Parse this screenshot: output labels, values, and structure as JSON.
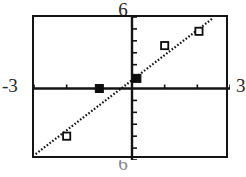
{
  "graph": {
    "type": "graphing-calculator-scatter",
    "window_labels": {
      "top": "6",
      "left": "-3",
      "right": "3",
      "bottom": "6"
    },
    "frame": {
      "x_min": -3,
      "x_max": 3,
      "y_min": -6,
      "y_max": 6
    }
  },
  "chart_data": {
    "type": "scatter",
    "title": "",
    "xlabel": "",
    "ylabel": "",
    "xlim": [
      -3,
      3
    ],
    "ylim": [
      -6,
      6
    ],
    "grid": false,
    "legend": false,
    "x_tick_interval": 1,
    "y_tick_interval": 1,
    "series": [
      {
        "name": "data-points-filled",
        "marker": "filled-square",
        "points": [
          {
            "x": -1.0,
            "y": 0.0
          },
          {
            "x": 0.15,
            "y": 0.85
          }
        ]
      },
      {
        "name": "data-points-open",
        "marker": "open-square",
        "points": [
          {
            "x": -2.0,
            "y": -4.0
          },
          {
            "x": 1.0,
            "y": 3.6
          },
          {
            "x": 2.05,
            "y": 4.8
          }
        ]
      }
    ],
    "trendline": {
      "name": "regression-line",
      "style": "dotted",
      "x_start": -2.95,
      "y_start": -5.5,
      "x_end": 2.45,
      "y_end": 5.85,
      "slope": 2.1,
      "intercept": 0.7
    }
  }
}
